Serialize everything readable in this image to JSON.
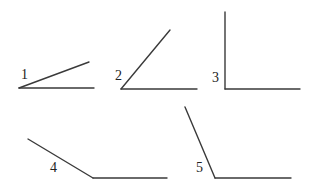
{
  "diagram": {
    "stroke_color": "#3a3a3a",
    "label_color": "#222222",
    "angles": [
      {
        "label": "1",
        "kind": "acute",
        "approx_degrees": 20,
        "vertex": [
          19,
          88
        ],
        "ray_end": [
          89,
          62
        ],
        "base_end": [
          94,
          88
        ],
        "label_pos": [
          21,
          79
        ]
      },
      {
        "label": "2",
        "kind": "acute",
        "approx_degrees": 50,
        "vertex": [
          121,
          89
        ],
        "ray_end": [
          170,
          30
        ],
        "base_end": [
          197,
          89
        ],
        "label_pos": [
          115,
          80
        ]
      },
      {
        "label": "3",
        "kind": "right",
        "approx_degrees": 90,
        "vertex": [
          225,
          89
        ],
        "ray_end": [
          225,
          12
        ],
        "base_end": [
          300,
          89
        ],
        "label_pos": [
          212,
          82
        ]
      },
      {
        "label": "4",
        "kind": "obtuse",
        "approx_degrees": 150,
        "vertex": [
          93,
          178
        ],
        "ray_end": [
          28,
          139
        ],
        "base_end": [
          167,
          178
        ],
        "label_pos": [
          50,
          172
        ]
      },
      {
        "label": "5",
        "kind": "obtuse",
        "approx_degrees": 113,
        "vertex": [
          215,
          178
        ],
        "ray_end": [
          185,
          107
        ],
        "base_end": [
          291,
          178
        ],
        "label_pos": [
          196,
          172
        ]
      }
    ]
  }
}
